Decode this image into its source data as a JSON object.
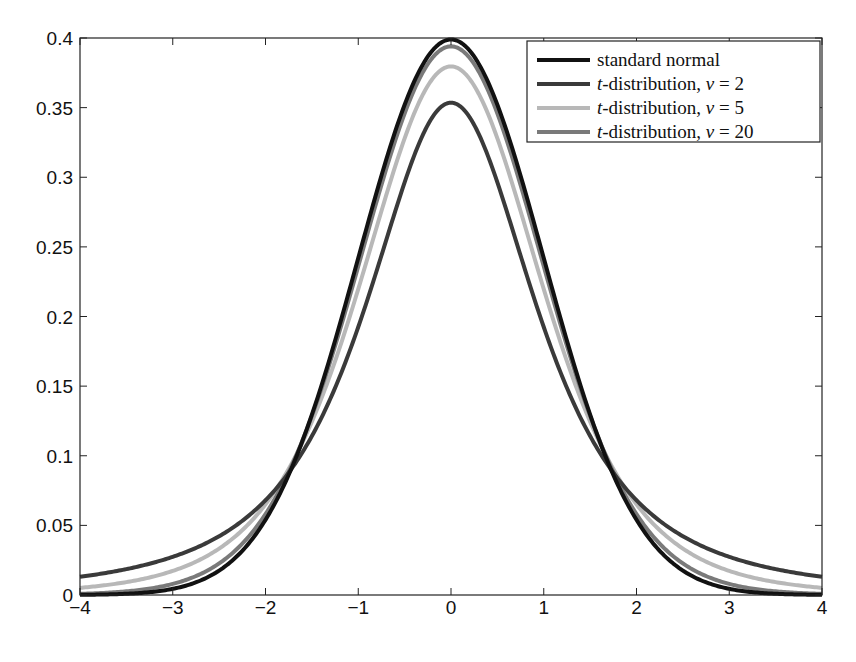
{
  "chart_data": {
    "type": "line",
    "title": "",
    "xlabel": "",
    "ylabel": "",
    "xlim": [
      -4,
      4
    ],
    "ylim": [
      0,
      0.4
    ],
    "grid": false,
    "legend_position": "upper right",
    "x_ticks": [
      -4,
      -3,
      -2,
      -1,
      0,
      1,
      2,
      3,
      4
    ],
    "x_tick_labels": [
      "−4",
      "−3",
      "−2",
      "−1",
      "0",
      "1",
      "2",
      "3",
      "4"
    ],
    "y_ticks": [
      0,
      0.05,
      0.1,
      0.15,
      0.2,
      0.25,
      0.3,
      0.35,
      0.4
    ],
    "y_tick_labels": [
      "0",
      "0.05",
      "0.1",
      "0.15",
      "0.2",
      "0.25",
      "0.3",
      "0.35",
      "0.4"
    ],
    "x": [
      -4,
      -3.5,
      -3,
      -2.5,
      -2,
      -1.5,
      -1,
      -0.5,
      0,
      0.5,
      1,
      1.5,
      2,
      2.5,
      3,
      3.5,
      4
    ],
    "series": [
      {
        "name": "standard normal",
        "color": "#111111",
        "values": [
          0.0001,
          0.0009,
          0.0044,
          0.0175,
          0.054,
          0.1295,
          0.242,
          0.3521,
          0.3989,
          0.3521,
          0.242,
          0.1295,
          0.054,
          0.0175,
          0.0044,
          0.0009,
          0.0001
        ]
      },
      {
        "name": "t-distribution, ν = 2",
        "color": "#3a3a3a",
        "values": [
          0.0131,
          0.0183,
          0.0274,
          0.0422,
          0.068,
          0.1114,
          0.1925,
          0.2985,
          0.3536,
          0.2985,
          0.1925,
          0.1114,
          0.068,
          0.0422,
          0.0274,
          0.0183,
          0.0131
        ]
      },
      {
        "name": "t-distribution, ν = 5",
        "color": "#b8b8b8",
        "values": [
          0.0051,
          0.0086,
          0.0173,
          0.0332,
          0.0651,
          0.1245,
          0.2197,
          0.3279,
          0.3796,
          0.3279,
          0.2197,
          0.1245,
          0.0651,
          0.0332,
          0.0173,
          0.0086,
          0.0051
        ]
      },
      {
        "name": "t-distribution, ν = 20",
        "color": "#7a7a7a",
        "values": [
          0.0006,
          0.0022,
          0.0069,
          0.0219,
          0.0581,
          0.1294,
          0.236,
          0.3454,
          0.394,
          0.3454,
          0.236,
          0.1294,
          0.0581,
          0.0219,
          0.0069,
          0.0022,
          0.0006
        ]
      }
    ]
  },
  "legend": {
    "items": [
      {
        "prefix": "",
        "italic": "",
        "text": "standard normal",
        "color": "#111111",
        "width": 4
      },
      {
        "prefix": "",
        "italic": "t",
        "text": "-distribution, ",
        "nu": "ν",
        "eq": " = 2",
        "color": "#3a3a3a",
        "width": 4
      },
      {
        "prefix": "",
        "italic": "t",
        "text": "-distribution, ",
        "nu": "ν",
        "eq": " = 5",
        "color": "#b8b8b8",
        "width": 4
      },
      {
        "prefix": "",
        "italic": "t",
        "text": "-distribution, ",
        "nu": "ν",
        "eq": " = 20",
        "color": "#7a7a7a",
        "width": 4
      }
    ]
  }
}
